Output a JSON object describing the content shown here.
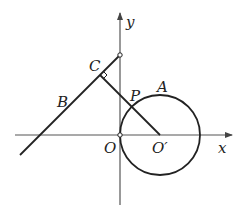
{
  "diagram": {
    "type": "coordinate-geometry",
    "axes": {
      "x_label": "x",
      "y_label": "y"
    },
    "points": {
      "O": "O",
      "O_prime": "O′",
      "P": "P",
      "A": "A",
      "B": "B",
      "C": "C"
    },
    "elements": [
      "circle centered at O′ passing through O",
      "line through B and C intersecting y-axis",
      "segment O′C perpendicular to line BC, meeting circle at P",
      "right-angle marker at C"
    ],
    "colors": {
      "stroke": "#222222",
      "axis": "#555555",
      "background": "#ffffff"
    }
  }
}
